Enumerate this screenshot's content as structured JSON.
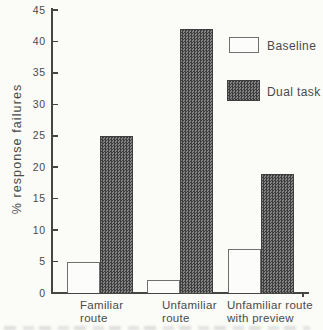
{
  "colors": {
    "background": "#fbfbf8",
    "axis": "#454545",
    "text": "#4a4a4a",
    "bar_outline": "#707070",
    "baseline_fill": "#fcfcfb",
    "dual_check_dark": "#3e3e3e",
    "dual_check_light": "#838383"
  },
  "chart_data": {
    "type": "bar",
    "title": "",
    "xlabel": "",
    "ylabel": "% response failures",
    "ylim": [
      0,
      45
    ],
    "yticks": [
      0,
      5,
      10,
      15,
      20,
      25,
      30,
      35,
      40,
      45
    ],
    "grid": false,
    "legend_position": "upper-right",
    "categories": [
      "Familiar route",
      "Unfamiliar route",
      "Unfamiliar route with preview"
    ],
    "category_lines": [
      [
        "Familiar",
        "route"
      ],
      [
        "Unfamiliar",
        "route"
      ],
      [
        "Unfamiliar route",
        "with preview"
      ]
    ],
    "series": [
      {
        "name": "Baseline",
        "style": "outline",
        "values": [
          5,
          2,
          7
        ]
      },
      {
        "name": "Dual task",
        "style": "checker",
        "values": [
          25,
          42,
          19
        ]
      }
    ]
  }
}
